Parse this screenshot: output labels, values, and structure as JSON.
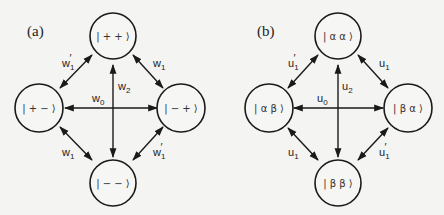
{
  "panels": [
    {
      "id": "a",
      "label": "(a)",
      "nodes": {
        "top": "| + + ⟩",
        "left": "| + − ⟩",
        "right": "| − + ⟩",
        "bottom": "| − − ⟩"
      },
      "edges": {
        "top_left": {
          "base": "w",
          "sub": "1",
          "prime": "′"
        },
        "top_right": {
          "base": "w",
          "sub": "1",
          "prime": ""
        },
        "left_right": {
          "base": "w",
          "sub": "0",
          "prime": ""
        },
        "top_bottom": {
          "base": "w",
          "sub": "2",
          "prime": ""
        },
        "left_bottom": {
          "base": "w",
          "sub": "1",
          "prime": ""
        },
        "right_bottom": {
          "base": "w",
          "sub": "1",
          "prime": "′"
        }
      }
    },
    {
      "id": "b",
      "label": "(b)",
      "nodes": {
        "top": "| α α ⟩",
        "left": "| α β ⟩",
        "right": "| β α ⟩",
        "bottom": "| β β ⟩"
      },
      "edges": {
        "top_left": {
          "base": "u",
          "sub": "1",
          "prime": "′"
        },
        "top_right": {
          "base": "u",
          "sub": "1",
          "prime": ""
        },
        "left_right": {
          "base": "u",
          "sub": "0",
          "prime": ""
        },
        "top_bottom": {
          "base": "u",
          "sub": "2",
          "prime": ""
        },
        "left_bottom": {
          "base": "u",
          "sub": "1",
          "prime": ""
        },
        "right_bottom": {
          "base": "u",
          "sub": "1",
          "prime": "′"
        }
      }
    }
  ]
}
